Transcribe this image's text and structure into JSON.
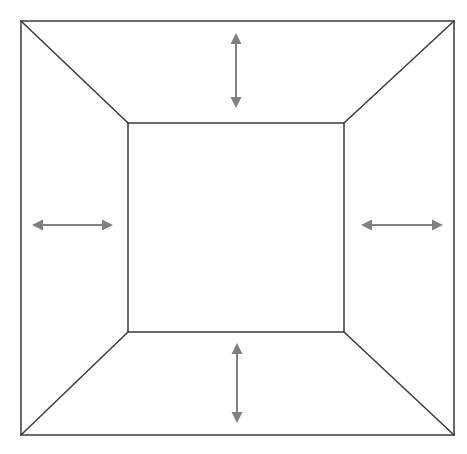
{
  "canvas": {
    "width": 467,
    "height": 454,
    "background": "#ffffff",
    "title": "Perspective frame expansion diagram"
  },
  "style": {
    "frame_stroke": "#3a3a3a",
    "frame_stroke_width": 1.5,
    "arrow_stroke": "#808080",
    "arrow_stroke_width": 2,
    "arrow_head_length": 11,
    "arrow_head_half_width": 5.5
  },
  "shapes": {
    "outer_rect": {
      "name": "outer-rectangle",
      "x": 21,
      "y": 21,
      "width": 433,
      "height": 414,
      "corners": {
        "top_left": [
          21,
          21
        ],
        "top_right": [
          454,
          21
        ],
        "bottom_right": [
          454,
          435
        ],
        "bottom_left": [
          21,
          435
        ]
      }
    },
    "inner_rect": {
      "name": "inner-rectangle",
      "x": 128,
      "y": 123,
      "width": 216,
      "height": 209,
      "corners": {
        "top_left": [
          128,
          123
        ],
        "top_right": [
          344,
          123
        ],
        "bottom_right": [
          344,
          332
        ],
        "bottom_left": [
          128,
          332
        ]
      }
    },
    "diagonals": [
      {
        "name": "diagonal-top-left",
        "x1": 21,
        "y1": 21,
        "x2": 128,
        "y2": 123
      },
      {
        "name": "diagonal-top-right",
        "x1": 454,
        "y1": 21,
        "x2": 344,
        "y2": 123
      },
      {
        "name": "diagonal-bottom-right",
        "x1": 454,
        "y1": 435,
        "x2": 344,
        "y2": 332
      },
      {
        "name": "diagonal-bottom-left",
        "x1": 21,
        "y1": 435,
        "x2": 128,
        "y2": 332
      }
    ]
  },
  "arrows": [
    {
      "name": "arrow-top",
      "orientation": "vertical",
      "direction": "double",
      "x1": 236,
      "y1": 33,
      "x2": 236,
      "y2": 108
    },
    {
      "name": "arrow-left",
      "orientation": "horizontal",
      "direction": "double",
      "x1": 32,
      "y1": 225,
      "x2": 113,
      "y2": 225
    },
    {
      "name": "arrow-right",
      "orientation": "horizontal",
      "direction": "double",
      "x1": 361,
      "y1": 225,
      "x2": 443,
      "y2": 225
    },
    {
      "name": "arrow-bottom",
      "orientation": "vertical",
      "direction": "double",
      "x1": 237,
      "y1": 343,
      "x2": 237,
      "y2": 423
    }
  ],
  "labels": {
    "none": ""
  }
}
